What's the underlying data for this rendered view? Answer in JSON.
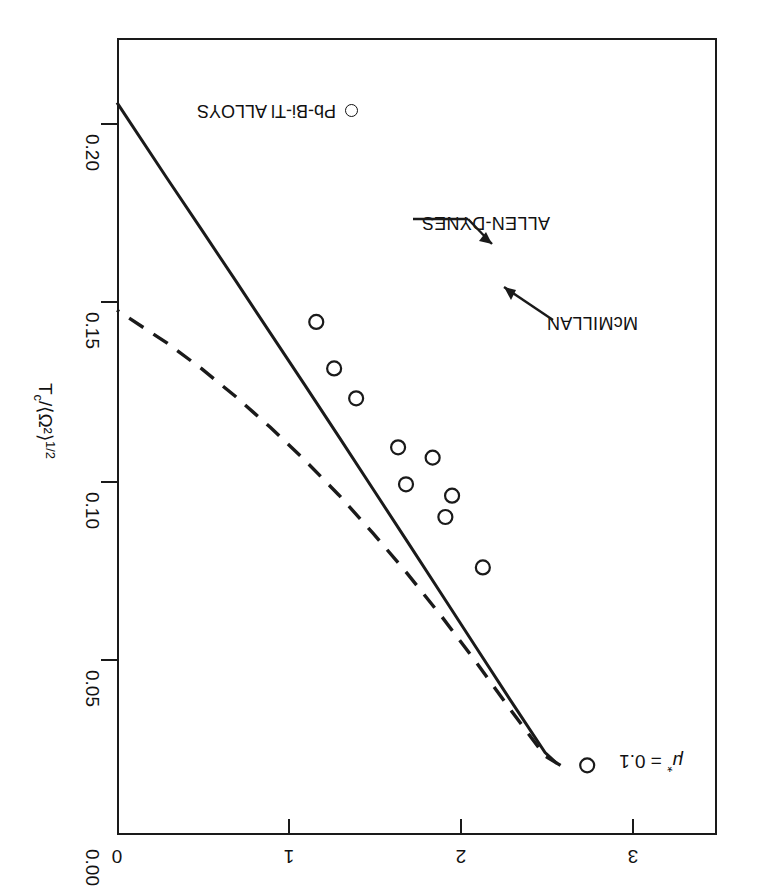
{
  "figure": {
    "annotation_mu": "μ* = 0.1",
    "annotation_mu_base": "μ",
    "annotation_mu_star": "*",
    "annotation_mu_value": " = 0.1"
  },
  "axes": {
    "x": {
      "label": "λ",
      "ticks": [
        "0",
        "1",
        "2",
        "3"
      ],
      "values": [
        0,
        1,
        2,
        3
      ],
      "range": [
        0,
        3.49
      ]
    },
    "y": {
      "label_main": "T",
      "label_sub": "c",
      "label_rest": "/⟨Ω²⟩",
      "label_sup": "1/2",
      "label_full": "T_c/⟨Ω²⟩^1/2",
      "ticks": [
        "0.00",
        "0.05",
        "0.10",
        "0.15",
        "0.20"
      ],
      "values": [
        0.0,
        0.05,
        0.1,
        0.15,
        0.2
      ],
      "range": [
        0.0,
        0.2243
      ]
    }
  },
  "curves": [
    {
      "name": "McMILLAN",
      "label": "McMILLAN",
      "style": "dashed"
    },
    {
      "name": "ALLEN-DYNES",
      "label": "ALLEN-DYNES",
      "style": "solid"
    }
  ],
  "legend": {
    "marker": "open-circle",
    "label": "Pb-Bi-Tl ALLOYS"
  },
  "chart_data": {
    "type": "line",
    "title": "",
    "xlabel": "λ",
    "ylabel": "T_c/⟨Ω²⟩^1/2",
    "xlim": [
      0,
      3.49
    ],
    "ylim": [
      0.0,
      0.2243
    ],
    "grid": false,
    "legend_position": "lower-left",
    "annotations": [
      {
        "text": "μ* = 0.1",
        "x": 2.95,
        "y": 0.0197
      },
      {
        "text": "McMILLAN",
        "x": 2.84,
        "y": 0.1425
      },
      {
        "text": "ALLEN-DYNES",
        "x": 2.28,
        "y": 0.1728
      }
    ],
    "series": [
      {
        "name": "McMILLAN",
        "style": "dashed",
        "x": [
          0.91,
          1.0,
          1.2,
          1.4,
          1.6,
          1.8,
          2.0,
          2.2,
          2.4,
          2.6,
          2.8,
          3.0,
          3.2,
          3.49
        ],
        "y": [
          0.0196,
          0.0222,
          0.0352,
          0.0486,
          0.0614,
          0.0735,
          0.0849,
          0.0957,
          0.1056,
          0.1148,
          0.1234,
          0.1313,
          0.1385,
          0.1477
        ]
      },
      {
        "name": "ALLEN-DYNES",
        "style": "solid",
        "x": [
          0.93,
          1.0,
          1.2,
          1.4,
          1.6,
          1.8,
          2.0,
          2.2,
          2.4,
          2.6,
          2.8,
          3.0,
          3.2,
          3.49
        ],
        "y": [
          0.0201,
          0.0232,
          0.0378,
          0.0527,
          0.0676,
          0.0825,
          0.0973,
          0.1121,
          0.1268,
          0.1414,
          0.156,
          0.1705,
          0.1849,
          0.2061
        ]
      }
    ],
    "points": {
      "name": "Pb-Bi-Tl ALLOYS",
      "marker": "open-circle",
      "x": [
        0.755,
        1.362,
        1.58,
        1.541,
        1.809,
        1.654,
        1.855,
        2.099,
        2.227,
        2.331
      ],
      "y": [
        0.0196,
        0.0753,
        0.0895,
        0.0955,
        0.0987,
        0.1062,
        0.1091,
        0.1229,
        0.1313,
        0.1444
      ]
    }
  }
}
